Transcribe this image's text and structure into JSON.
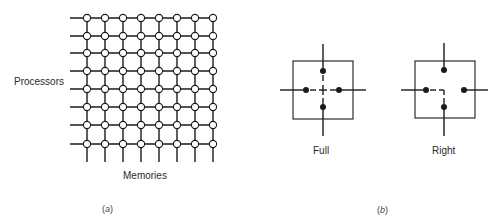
{
  "panel_a": {
    "row_label": "Processors",
    "column_label": "Memories",
    "caption_open": "(",
    "caption_letter": "a",
    "caption_close": ")",
    "grid": {
      "rows": 8,
      "columns": 8,
      "node_shape": "open-circle"
    }
  },
  "panel_b": {
    "switches": [
      {
        "label": "Full",
        "state": "full",
        "description": "all four ports interconnected (crossbar crossing)"
      },
      {
        "label": "Right",
        "state": "right",
        "description": "left port routed down; top and right ports idle"
      }
    ],
    "caption_open": "(",
    "caption_letter": "b",
    "caption_close": ")"
  },
  "colors": {
    "line": "#1a1a1a",
    "background": "#ffffff"
  }
}
